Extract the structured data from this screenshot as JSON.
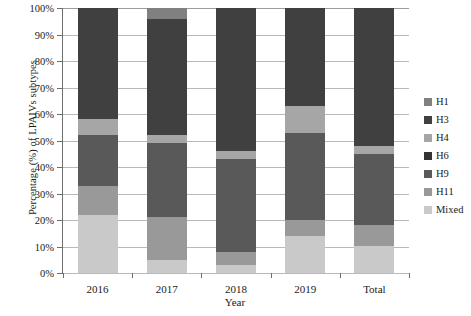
{
  "chart_data": {
    "type": "bar",
    "subtype": "stacked-bar-100pct",
    "title": "",
    "xlabel": "Year",
    "ylabel": "Percentage (%) of LPAIVs subtypes",
    "ylim": [
      0,
      100
    ],
    "ytick_labels": [
      "0%",
      "10%",
      "20%",
      "30%",
      "40%",
      "50%",
      "60%",
      "70%",
      "80%",
      "90%",
      "100%"
    ],
    "ytick_values": [
      0,
      10,
      20,
      30,
      40,
      50,
      60,
      70,
      80,
      90,
      100
    ],
    "grid": true,
    "legend_position": "right",
    "categories": [
      "2016",
      "2017",
      "2018",
      "2019",
      "Total"
    ],
    "stack_order_bottom_to_top": [
      "Mixed",
      "H11",
      "H9",
      "H4",
      "H3",
      "H1"
    ],
    "series": [
      {
        "name": "H1",
        "color": "#808080",
        "values": [
          0,
          4,
          0,
          0,
          0
        ]
      },
      {
        "name": "H3",
        "color": "#404040",
        "values": [
          42,
          44,
          54,
          37,
          52
        ]
      },
      {
        "name": "H4",
        "color": "#a6a6a6",
        "values": [
          6,
          3,
          3,
          10,
          3
        ]
      },
      {
        "name": "H6",
        "color": "#333333",
        "values": [
          0,
          0,
          0,
          0,
          0
        ]
      },
      {
        "name": "H9",
        "color": "#595959",
        "values": [
          19,
          28,
          35,
          33,
          27
        ]
      },
      {
        "name": "H11",
        "color": "#999999",
        "values": [
          11,
          16,
          5,
          6,
          8
        ]
      },
      {
        "name": "Mixed",
        "color": "#c9c9c9",
        "values": [
          22,
          5,
          3,
          14,
          10
        ]
      }
    ]
  },
  "legend": {
    "items": [
      {
        "label": "H1",
        "color": "#808080"
      },
      {
        "label": "H3",
        "color": "#404040"
      },
      {
        "label": "H4",
        "color": "#a6a6a6"
      },
      {
        "label": "H6",
        "color": "#333333"
      },
      {
        "label": "H9",
        "color": "#595959"
      },
      {
        "label": "H11",
        "color": "#999999"
      },
      {
        "label": "Mixed",
        "color": "#c9c9c9"
      }
    ]
  }
}
